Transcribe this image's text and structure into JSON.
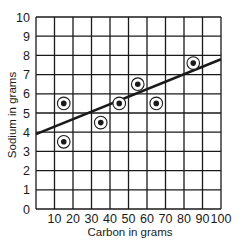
{
  "chart_data": {
    "type": "scatter",
    "title": "",
    "xlabel": "Carbon in grams",
    "ylabel": "Sodium in grams",
    "xlim": [
      0,
      100
    ],
    "ylim": [
      0,
      10
    ],
    "grid": true,
    "legend": null,
    "x_ticks": [
      10,
      20,
      30,
      40,
      50,
      60,
      70,
      80,
      90,
      100
    ],
    "y_ticks": [
      0,
      1,
      2,
      3,
      4,
      5,
      6,
      7,
      8,
      9,
      10
    ],
    "series": [
      {
        "name": "data points",
        "marker": "circled-dot",
        "points": [
          {
            "x": 15,
            "y": 5.5
          },
          {
            "x": 15,
            "y": 3.5
          },
          {
            "x": 35,
            "y": 4.5
          },
          {
            "x": 45,
            "y": 5.5
          },
          {
            "x": 55,
            "y": 6.5
          },
          {
            "x": 65,
            "y": 5.5
          },
          {
            "x": 85,
            "y": 7.6
          }
        ]
      },
      {
        "name": "line of best fit",
        "type": "line",
        "points": [
          {
            "x": 0,
            "y": 3.9
          },
          {
            "x": 100,
            "y": 7.8
          }
        ]
      }
    ]
  },
  "colors": {
    "ink": "#1a1a1a",
    "grid": "#1a1a1a",
    "background": "#ffffff"
  }
}
